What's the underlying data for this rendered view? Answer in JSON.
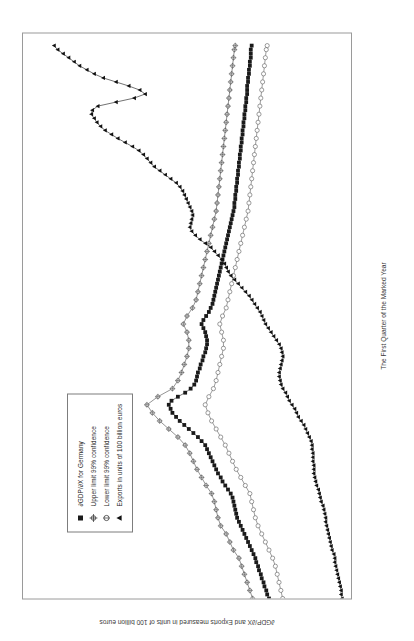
{
  "chart_data": {
    "type": "line",
    "title": "",
    "xlabel": "The First Quarter of the Marked Year",
    "ylabel": "∂GDP/∂X and Exports measured in units of 100 billion euros",
    "xlim": [
      1978,
      2013
    ],
    "ylim": [
      0.2,
      3.8
    ],
    "ytick_labels": [
      "3.8",
      "3.6",
      "3.4",
      "3.2",
      "3",
      "2.8",
      "2.6",
      "2.4",
      "2.2",
      "2",
      "1.8",
      "1.6",
      "1.4",
      "1.2",
      "1",
      "0.8",
      "0.6",
      "0.4",
      "0.2"
    ],
    "ytick_values": [
      3.8,
      3.6,
      3.4,
      3.2,
      3.0,
      2.8,
      2.6,
      2.4,
      2.2,
      2.0,
      1.8,
      1.6,
      1.4,
      1.2,
      1.0,
      0.8,
      0.6,
      0.4,
      0.2
    ],
    "xtick_labels": [
      "1978",
      "1980",
      "1982",
      "1984",
      "1986",
      "1988",
      "1990",
      "1992",
      "1994",
      "1996",
      "1998",
      "2000",
      "2002",
      "2004",
      "2006",
      "2008",
      "2010",
      "2012"
    ],
    "xtick_values": [
      1978,
      1980,
      1982,
      1984,
      1986,
      1988,
      1990,
      1992,
      1994,
      1996,
      1998,
      2000,
      2002,
      2004,
      2006,
      2008,
      2010,
      2012
    ],
    "grid": false,
    "legend_position": "upper-left",
    "series": [
      {
        "name": "∂GDP/∂X for Germany",
        "marker": "filled-square",
        "color": "#1a1a1a",
        "x": [
          1978.0,
          1978.25,
          1978.5,
          1978.75,
          1979.0,
          1979.25,
          1979.5,
          1979.75,
          1980.0,
          1980.25,
          1980.5,
          1980.75,
          1981.0,
          1981.25,
          1981.5,
          1981.75,
          1982.0,
          1982.25,
          1982.5,
          1982.75,
          1983.0,
          1983.25,
          1983.5,
          1983.75,
          1984.0,
          1984.25,
          1984.5,
          1984.75,
          1985.0,
          1985.25,
          1985.5,
          1985.75,
          1986.0,
          1986.25,
          1986.5,
          1986.75,
          1987.0,
          1987.25,
          1987.5,
          1987.75,
          1988.0,
          1988.25,
          1988.5,
          1988.75,
          1989.0,
          1989.25,
          1989.5,
          1989.75,
          1990.0,
          1990.25,
          1990.5,
          1990.75,
          1991.0,
          1991.25,
          1991.5,
          1991.75,
          1992.0,
          1992.25,
          1992.5,
          1992.75,
          1993.0,
          1993.25,
          1993.5,
          1993.75,
          1994.0,
          1994.25,
          1994.5,
          1994.75,
          1995.0,
          1995.25,
          1995.5,
          1995.75,
          1996.0,
          1996.25,
          1996.5,
          1996.75,
          1997.0,
          1997.25,
          1997.5,
          1997.75,
          1998.0,
          1998.25,
          1998.5,
          1998.75,
          1999.0,
          1999.25,
          1999.5,
          1999.75,
          2000.0,
          2000.25,
          2000.5,
          2000.75,
          2001.0,
          2001.25,
          2001.5,
          2001.75,
          2002.0,
          2002.25,
          2002.5,
          2002.75,
          2003.0,
          2003.25,
          2003.5,
          2003.75,
          2004.0,
          2004.25,
          2004.5,
          2004.75,
          2005.0,
          2005.25,
          2005.5,
          2005.75,
          2006.0,
          2006.25,
          2006.5,
          2006.75,
          2007.0,
          2007.25,
          2007.5,
          2007.75,
          2008.0,
          2008.25,
          2008.5,
          2008.75,
          2009.0,
          2009.25,
          2009.5,
          2009.75,
          2010.0,
          2010.25,
          2010.5,
          2010.75,
          2011.0,
          2011.25,
          2011.5,
          2011.75,
          2012.0,
          2012.25
        ],
        "y": [
          1.1,
          1.12,
          1.13,
          1.15,
          1.16,
          1.18,
          1.19,
          1.21,
          1.22,
          1.24,
          1.25,
          1.27,
          1.29,
          1.31,
          1.33,
          1.35,
          1.37,
          1.39,
          1.41,
          1.43,
          1.45,
          1.46,
          1.47,
          1.48,
          1.49,
          1.5,
          1.52,
          1.55,
          1.58,
          1.61,
          1.63,
          1.66,
          1.68,
          1.7,
          1.72,
          1.74,
          1.76,
          1.78,
          1.8,
          1.84,
          1.88,
          1.93,
          1.98,
          2.03,
          2.08,
          2.12,
          2.16,
          2.18,
          2.2,
          2.17,
          2.1,
          2.02,
          1.96,
          1.92,
          1.9,
          1.89,
          1.88,
          1.86,
          1.85,
          1.83,
          1.82,
          1.8,
          1.79,
          1.78,
          1.78,
          1.79,
          1.8,
          1.82,
          1.84,
          1.82,
          1.79,
          1.76,
          1.74,
          1.72,
          1.71,
          1.7,
          1.69,
          1.68,
          1.67,
          1.66,
          1.65,
          1.64,
          1.63,
          1.62,
          1.61,
          1.6,
          1.59,
          1.58,
          1.57,
          1.56,
          1.55,
          1.54,
          1.53,
          1.52,
          1.51,
          1.5,
          1.49,
          1.48,
          1.48,
          1.47,
          1.47,
          1.46,
          1.46,
          1.45,
          1.45,
          1.44,
          1.44,
          1.43,
          1.43,
          1.42,
          1.42,
          1.41,
          1.41,
          1.4,
          1.4,
          1.39,
          1.39,
          1.38,
          1.38,
          1.37,
          1.37,
          1.36,
          1.36,
          1.35,
          1.35,
          1.34,
          1.34,
          1.34,
          1.33,
          1.33,
          1.32,
          1.32,
          1.31,
          1.31,
          1.3,
          1.3,
          1.3,
          1.29
        ]
      },
      {
        "name": "Upper limit 99% confidence",
        "marker": "cross-circle",
        "color": "#4a4a4a",
        "x": [
          1978.0,
          1978.5,
          1979.0,
          1979.5,
          1980.0,
          1980.5,
          1981.0,
          1981.5,
          1982.0,
          1982.5,
          1983.0,
          1983.5,
          1984.0,
          1984.5,
          1985.0,
          1985.5,
          1986.0,
          1986.5,
          1987.0,
          1987.5,
          1988.0,
          1988.5,
          1989.0,
          1989.5,
          1990.0,
          1990.5,
          1991.0,
          1991.5,
          1992.0,
          1992.5,
          1993.0,
          1993.5,
          1994.0,
          1994.5,
          1995.0,
          1995.5,
          1996.0,
          1996.5,
          1997.0,
          1997.5,
          1998.0,
          1998.5,
          1999.0,
          1999.5,
          2000.0,
          2000.5,
          2001.0,
          2001.5,
          2002.0,
          2002.5,
          2003.0,
          2003.5,
          2004.0,
          2004.5,
          2005.0,
          2005.5,
          2006.0,
          2006.5,
          2007.0,
          2007.5,
          2008.0,
          2008.5,
          2009.0,
          2009.5,
          2010.0,
          2010.5,
          2011.0,
          2011.5,
          2012.0,
          2012.25
        ],
        "y": [
          1.28,
          1.31,
          1.34,
          1.37,
          1.4,
          1.43,
          1.49,
          1.53,
          1.57,
          1.63,
          1.66,
          1.68,
          1.7,
          1.73,
          1.79,
          1.84,
          1.89,
          1.93,
          1.97,
          2.02,
          2.1,
          2.2,
          2.3,
          2.38,
          2.44,
          2.32,
          2.16,
          2.1,
          2.06,
          2.03,
          2.0,
          1.98,
          1.98,
          2.0,
          2.04,
          2.0,
          1.94,
          1.9,
          1.88,
          1.86,
          1.84,
          1.82,
          1.8,
          1.78,
          1.76,
          1.74,
          1.72,
          1.7,
          1.68,
          1.67,
          1.66,
          1.65,
          1.64,
          1.63,
          1.62,
          1.61,
          1.6,
          1.59,
          1.58,
          1.57,
          1.56,
          1.55,
          1.54,
          1.53,
          1.52,
          1.51,
          1.5,
          1.49,
          1.48,
          1.47
        ]
      },
      {
        "name": "Lower limit 99% confidence",
        "marker": "open-circle",
        "color": "#5a5a5a",
        "x": [
          1978.0,
          1978.5,
          1979.0,
          1979.5,
          1980.0,
          1980.5,
          1981.0,
          1981.5,
          1982.0,
          1982.5,
          1983.0,
          1983.5,
          1984.0,
          1984.5,
          1985.0,
          1985.5,
          1986.0,
          1986.5,
          1987.0,
          1987.5,
          1988.0,
          1988.5,
          1989.0,
          1989.5,
          1990.0,
          1990.5,
          1991.0,
          1991.5,
          1992.0,
          1992.5,
          1993.0,
          1993.5,
          1994.0,
          1994.5,
          1995.0,
          1995.5,
          1996.0,
          1996.5,
          1997.0,
          1997.5,
          1998.0,
          1998.5,
          1999.0,
          1999.5,
          2000.0,
          2000.5,
          2001.0,
          2001.5,
          2002.0,
          2002.5,
          2003.0,
          2003.5,
          2004.0,
          2004.5,
          2005.0,
          2005.5,
          2006.0,
          2006.5,
          2007.0,
          2007.5,
          2008.0,
          2008.5,
          2009.0,
          2009.5,
          2010.0,
          2010.5,
          2011.0,
          2011.5,
          2012.0,
          2012.25
        ],
        "y": [
          0.95,
          0.97,
          0.99,
          1.01,
          1.03,
          1.06,
          1.1,
          1.14,
          1.18,
          1.22,
          1.25,
          1.27,
          1.29,
          1.31,
          1.36,
          1.41,
          1.46,
          1.5,
          1.54,
          1.58,
          1.63,
          1.68,
          1.73,
          1.77,
          1.8,
          1.76,
          1.71,
          1.68,
          1.66,
          1.64,
          1.62,
          1.6,
          1.6,
          1.62,
          1.64,
          1.61,
          1.57,
          1.55,
          1.53,
          1.51,
          1.49,
          1.47,
          1.45,
          1.43,
          1.41,
          1.39,
          1.37,
          1.35,
          1.33,
          1.32,
          1.31,
          1.3,
          1.29,
          1.28,
          1.27,
          1.26,
          1.25,
          1.24,
          1.23,
          1.22,
          1.21,
          1.2,
          1.19,
          1.18,
          1.17,
          1.16,
          1.15,
          1.14,
          1.13,
          1.12
        ]
      },
      {
        "name": "Exports in units of 100 billion euros",
        "marker": "filled-triangle",
        "color": "#111111",
        "x": [
          1978.0,
          1978.25,
          1978.5,
          1978.75,
          1979.0,
          1979.25,
          1979.5,
          1979.75,
          1980.0,
          1980.25,
          1980.5,
          1980.75,
          1981.0,
          1981.25,
          1981.5,
          1981.75,
          1982.0,
          1982.25,
          1982.5,
          1982.75,
          1983.0,
          1983.25,
          1983.5,
          1983.75,
          1984.0,
          1984.25,
          1984.5,
          1984.75,
          1985.0,
          1985.25,
          1985.5,
          1985.75,
          1986.0,
          1986.25,
          1986.5,
          1986.75,
          1987.0,
          1987.25,
          1987.5,
          1987.75,
          1988.0,
          1988.25,
          1988.5,
          1988.75,
          1989.0,
          1989.25,
          1989.5,
          1989.75,
          1990.0,
          1990.25,
          1990.5,
          1990.75,
          1991.0,
          1991.25,
          1991.5,
          1991.75,
          1992.0,
          1992.25,
          1992.5,
          1992.75,
          1993.0,
          1993.25,
          1993.5,
          1993.75,
          1994.0,
          1994.25,
          1994.5,
          1994.75,
          1995.0,
          1995.25,
          1995.5,
          1995.75,
          1996.0,
          1996.25,
          1996.5,
          1996.75,
          1997.0,
          1997.25,
          1997.5,
          1997.75,
          1998.0,
          1998.25,
          1998.5,
          1998.75,
          1999.0,
          1999.25,
          1999.5,
          1999.75,
          2000.0,
          2000.25,
          2000.5,
          2000.75,
          2001.0,
          2001.25,
          2001.5,
          2001.75,
          2002.0,
          2002.25,
          2002.5,
          2002.75,
          2003.0,
          2003.25,
          2003.5,
          2003.75,
          2004.0,
          2004.25,
          2004.5,
          2004.75,
          2005.0,
          2005.25,
          2005.5,
          2005.75,
          2006.0,
          2006.25,
          2006.5,
          2006.75,
          2007.0,
          2007.25,
          2007.5,
          2007.75,
          2008.0,
          2008.25,
          2008.5,
          2008.75,
          2009.0,
          2009.25,
          2009.5,
          2009.75,
          2010.0,
          2010.25,
          2010.5,
          2010.75,
          2011.0,
          2011.25,
          2011.5,
          2011.75,
          2012.0,
          2012.25
        ],
        "y": [
          0.3,
          0.31,
          0.31,
          0.32,
          0.33,
          0.34,
          0.35,
          0.36,
          0.37,
          0.38,
          0.38,
          0.39,
          0.41,
          0.42,
          0.43,
          0.44,
          0.45,
          0.46,
          0.47,
          0.48,
          0.48,
          0.49,
          0.5,
          0.51,
          0.53,
          0.54,
          0.55,
          0.56,
          0.58,
          0.59,
          0.6,
          0.61,
          0.61,
          0.61,
          0.62,
          0.62,
          0.62,
          0.63,
          0.63,
          0.64,
          0.66,
          0.68,
          0.7,
          0.72,
          0.75,
          0.78,
          0.8,
          0.82,
          0.85,
          0.88,
          0.9,
          0.92,
          0.95,
          0.97,
          0.98,
          0.99,
          0.99,
          0.98,
          0.97,
          0.96,
          0.95,
          0.96,
          0.97,
          0.99,
          1.02,
          1.05,
          1.08,
          1.11,
          1.14,
          1.16,
          1.18,
          1.2,
          1.23,
          1.26,
          1.29,
          1.32,
          1.36,
          1.4,
          1.44,
          1.48,
          1.52,
          1.55,
          1.57,
          1.59,
          1.62,
          1.66,
          1.7,
          1.74,
          1.8,
          1.86,
          1.91,
          1.95,
          1.97,
          1.96,
          1.95,
          1.94,
          1.95,
          1.97,
          1.99,
          2.01,
          2.03,
          2.05,
          2.08,
          2.12,
          2.18,
          2.24,
          2.3,
          2.36,
          2.4,
          2.44,
          2.48,
          2.53,
          2.6,
          2.68,
          2.76,
          2.83,
          2.9,
          2.95,
          2.99,
          3.02,
          3.05,
          3.04,
          2.98,
          2.78,
          2.58,
          2.46,
          2.52,
          2.64,
          2.78,
          2.92,
          3.02,
          3.1,
          3.18,
          3.24,
          3.3,
          3.36,
          3.42,
          3.46
        ]
      }
    ]
  },
  "legend": {
    "items": [
      {
        "label": "∂GDP/∂X for Germany",
        "marker": "filled-square"
      },
      {
        "label": "Upper limit 99% confidence",
        "marker": "cross-circle"
      },
      {
        "label": "Lower limit 99% confidence",
        "marker": "open-circle"
      },
      {
        "label": "Exports in units of 100 billion euros",
        "marker": "filled-triangle"
      }
    ]
  },
  "axes": {
    "x_title": "The First Quarter of the Marked Year",
    "y_title": "∂GDP/∂X and Exports measured in units of 100 billion euros"
  }
}
